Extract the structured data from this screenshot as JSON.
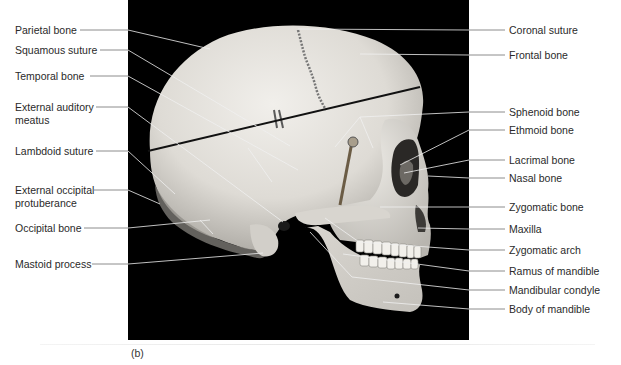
{
  "figure": {
    "panel_label": "(b)",
    "colors": {
      "photo_background": "#000000",
      "bone": "#e6e4df",
      "leader_line_outside": "#6e6e6e",
      "leader_line_inside": "#f0f0f0",
      "label_text": "#2a2a2a"
    }
  },
  "labels_left": [
    {
      "id": "parietal-bone",
      "text": "Parietal bone"
    },
    {
      "id": "squamous-suture",
      "text": "Squamous suture"
    },
    {
      "id": "temporal-bone",
      "text": "Temporal bone"
    },
    {
      "id": "external-auditory-meatus",
      "text": "External auditory meatus"
    },
    {
      "id": "lambdoid-suture",
      "text": "Lambdoid suture"
    },
    {
      "id": "external-occipital-protuberance",
      "text": "External occipital protuberance"
    },
    {
      "id": "occipital-bone",
      "text": "Occipital bone"
    },
    {
      "id": "mastoid-process",
      "text": "Mastoid process"
    }
  ],
  "labels_right": [
    {
      "id": "coronal-suture",
      "text": "Coronal suture"
    },
    {
      "id": "frontal-bone",
      "text": "Frontal bone"
    },
    {
      "id": "sphenoid-bone",
      "text": "Sphenoid bone"
    },
    {
      "id": "ethmoid-bone",
      "text": "Ethmoid bone"
    },
    {
      "id": "lacrimal-bone",
      "text": "Lacrimal bone"
    },
    {
      "id": "nasal-bone",
      "text": "Nasal bone"
    },
    {
      "id": "zygomatic-bone",
      "text": "Zygomatic bone"
    },
    {
      "id": "maxilla",
      "text": "Maxilla"
    },
    {
      "id": "zygomatic-arch",
      "text": "Zygomatic arch"
    },
    {
      "id": "ramus-of-mandible",
      "text": "Ramus of mandible"
    },
    {
      "id": "mandibular-condyle",
      "text": "Mandibular condyle"
    },
    {
      "id": "body-of-mandible",
      "text": "Body of mandible"
    }
  ]
}
